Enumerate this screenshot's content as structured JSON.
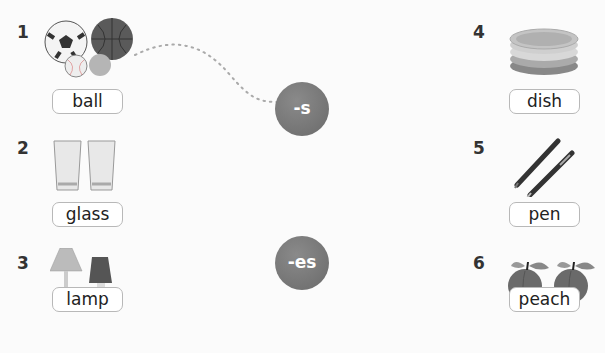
{
  "items": [
    {
      "number": "1",
      "word": "ball",
      "icon": "balls-icon"
    },
    {
      "number": "2",
      "word": "glass",
      "icon": "glasses-icon"
    },
    {
      "number": "3",
      "word": "lamp",
      "icon": "lamps-icon"
    },
    {
      "number": "4",
      "word": "dish",
      "icon": "dishes-icon"
    },
    {
      "number": "5",
      "word": "pen",
      "icon": "pens-icon"
    },
    {
      "number": "6",
      "word": "peach",
      "icon": "peaches-icon"
    }
  ],
  "endings": [
    {
      "label": "-s"
    },
    {
      "label": "-es"
    }
  ],
  "connection": {
    "from": "ball",
    "to": "-s"
  }
}
